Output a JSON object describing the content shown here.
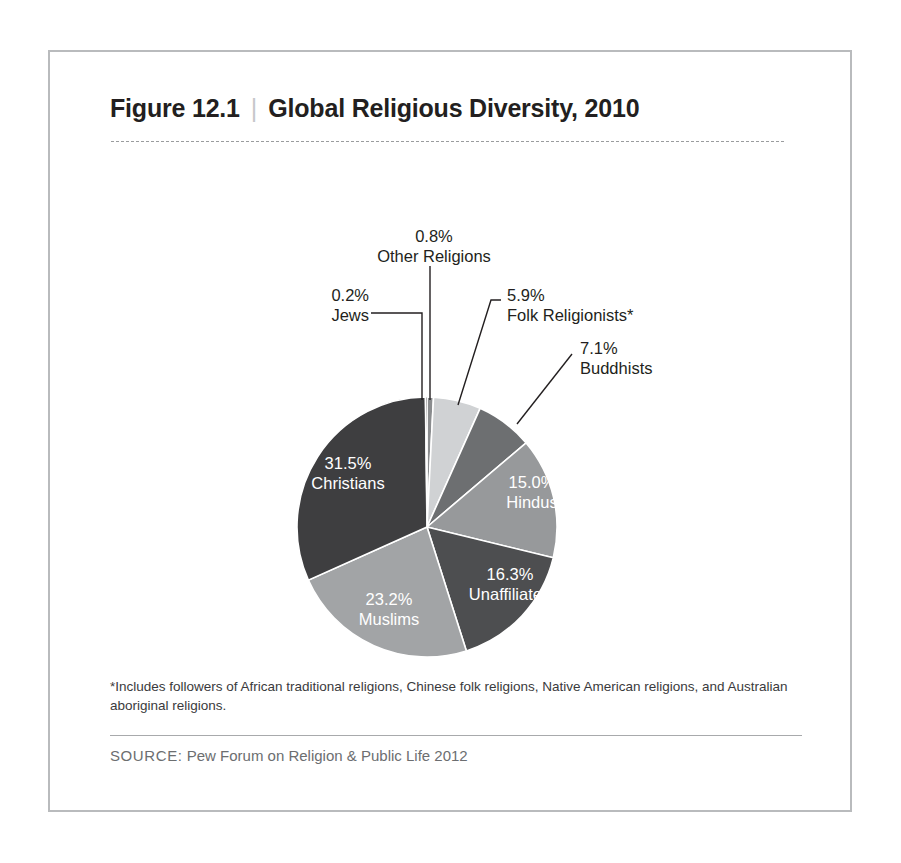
{
  "figure": {
    "number_label": "Figure 12.1",
    "separator": "|",
    "title": "Global Religious Diversity, 2010",
    "footnote": "*Includes followers of African traditional religions, Chinese folk religions, Native American religions, and Australian aboriginal religions.",
    "source_label": "SOURCE:",
    "source_text": "Pew Forum on Religion & Public Life 2012",
    "frame_color": "#b9bbbd"
  },
  "chart_data": {
    "type": "pie",
    "title": "Global Religious Diversity, 2010",
    "units": "percent",
    "categories": [
      "Christians",
      "Muslims",
      "Unaffiliated",
      "Hindus",
      "Buddhists",
      "Folk Religionists*",
      "Other Religions",
      "Jews"
    ],
    "values": [
      31.5,
      23.2,
      16.3,
      15.0,
      7.1,
      5.9,
      0.8,
      0.2
    ],
    "labels": [
      {
        "name": "Christians",
        "pct": "31.5%",
        "value": 31.5,
        "color": "#3e3e40",
        "text_color": "#ffffff",
        "placement": "inside"
      },
      {
        "name": "Muslims",
        "pct": "23.2%",
        "value": 23.2,
        "color": "#a2a4a6",
        "text_color": "#ffffff",
        "placement": "inside"
      },
      {
        "name": "Unaffiliated",
        "pct": "16.3%",
        "value": 16.3,
        "color": "#4d4e50",
        "text_color": "#ffffff",
        "placement": "inside"
      },
      {
        "name": "Hindus",
        "pct": "15.0%",
        "value": 15.0,
        "color": "#97999b",
        "text_color": "#ffffff",
        "placement": "inside"
      },
      {
        "name": "Buddhists",
        "pct": "7.1%",
        "value": 7.1,
        "color": "#6d6f71",
        "text_color": "#231f20",
        "placement": "outside"
      },
      {
        "name": "Folk Religionists*",
        "pct": "5.9%",
        "value": 5.9,
        "color": "#d0d2d4",
        "text_color": "#231f20",
        "placement": "outside"
      },
      {
        "name": "Other Religions",
        "pct": "0.8%",
        "value": 0.8,
        "color": "#8a8c8e",
        "text_color": "#231f20",
        "placement": "outside"
      },
      {
        "name": "Jews",
        "pct": "0.2%",
        "value": 0.2,
        "color": "#3e3e40",
        "text_color": "#231f20",
        "placement": "outside"
      }
    ],
    "legend": "none",
    "grid": false
  }
}
